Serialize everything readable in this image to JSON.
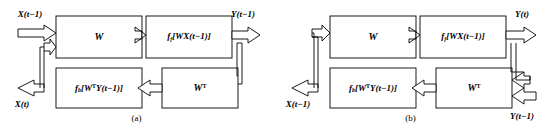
{
  "figure": {
    "background": "#ffffff",
    "stroke": "#000000",
    "panels": [
      {
        "id": "a",
        "caption": "(a)",
        "boxes": [
          {
            "name": "weight-forward",
            "label_main": "W",
            "label_sup": "",
            "x": 56,
            "y": 16,
            "w": 86,
            "h": 42
          },
          {
            "name": "activation-forward",
            "label_pre": "f",
            "label_sub": "f",
            "label_body": "[WX(t−1)]",
            "x": 146,
            "y": 16,
            "w": 86,
            "h": 42
          },
          {
            "name": "activation-backward",
            "label_pre": "f",
            "label_sub": "b",
            "label_body": "[W",
            "label_sup": "T",
            "label_tail": "Y(t−1)]",
            "x": 56,
            "y": 68,
            "w": 86,
            "h": 40
          },
          {
            "name": "weight-transpose",
            "label_main": "W",
            "label_sup": "T",
            "x": 162,
            "y": 68,
            "w": 76,
            "h": 40
          }
        ],
        "io": [
          {
            "name": "input-x",
            "text": "X(t−1)",
            "x": 30,
            "y": 14
          },
          {
            "name": "output-y",
            "text": "Y(t−1)",
            "x": 243,
            "y": 14
          },
          {
            "name": "output-x",
            "text": "X(t)",
            "x": 22,
            "y": 104
          }
        ]
      },
      {
        "id": "b",
        "caption": "(b)",
        "boxes": [
          {
            "name": "weight-forward",
            "label_main": "W",
            "label_sup": "",
            "x": 56,
            "y": 16,
            "w": 86,
            "h": 42
          },
          {
            "name": "activation-forward",
            "label_pre": "f",
            "label_sub": "f",
            "label_body": "[WX(t−1)]",
            "x": 146,
            "y": 16,
            "w": 86,
            "h": 42
          },
          {
            "name": "activation-backward",
            "label_pre": "f",
            "label_sub": "b",
            "label_body": "[W",
            "label_sup": "T",
            "label_tail": "Y(t−1)]",
            "x": 56,
            "y": 68,
            "w": 86,
            "h": 40
          },
          {
            "name": "weight-transpose",
            "label_main": "W",
            "label_sup": "T",
            "x": 162,
            "y": 68,
            "w": 76,
            "h": 40
          }
        ],
        "io": [
          {
            "name": "output-y",
            "text": "Y(t)",
            "x": 248,
            "y": 14
          },
          {
            "name": "output-x",
            "text": "X(t−1)",
            "x": 24,
            "y": 104
          },
          {
            "name": "input-y",
            "text": "Y(t−1)",
            "x": 248,
            "y": 116
          }
        ]
      }
    ]
  }
}
